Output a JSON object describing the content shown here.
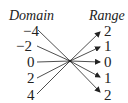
{
  "headers": {
    "domain": "Domain",
    "range": "Range"
  },
  "domain_values": [
    "−4",
    "−2",
    "0",
    "2",
    "4"
  ],
  "range_values": [
    "2",
    "1",
    "0",
    "1",
    "2"
  ],
  "mapping": [
    {
      "from": "−4",
      "to": "2"
    },
    {
      "from": "−2",
      "to": "1"
    },
    {
      "from": "0",
      "to": "0"
    },
    {
      "from": "2",
      "to": "1"
    },
    {
      "from": "4",
      "to": "2"
    }
  ],
  "colors": {
    "line": "#222222"
  }
}
